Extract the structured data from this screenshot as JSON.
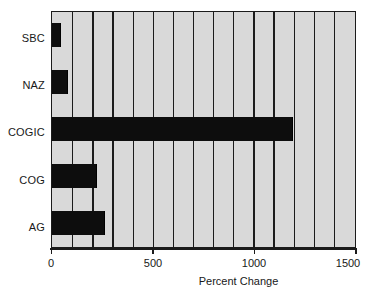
{
  "chart_data": {
    "type": "bar",
    "orientation": "horizontal",
    "title": "",
    "subtitle": "",
    "xlabel": "Percent Change",
    "ylabel": "",
    "xlim": [
      0,
      1500
    ],
    "xticks": [
      0,
      500,
      1000,
      1500
    ],
    "xtick_labels": [
      "0",
      "500",
      "1000",
      "1500"
    ],
    "gridlines": {
      "axis": "x",
      "visible": true,
      "interval": 100,
      "values": [
        100,
        200,
        300,
        400,
        500,
        600,
        700,
        800,
        900,
        1000,
        1100,
        1200,
        1300,
        1400
      ]
    },
    "legend": {
      "visible": false,
      "position": "none"
    },
    "categories": [
      "SBC",
      "NAZ",
      "COGIC",
      "COG",
      "AG"
    ],
    "values": [
      45,
      80,
      1195,
      225,
      265
    ],
    "bars": [
      {
        "label": "SBC",
        "value": 45,
        "color": "#0d0d0d"
      },
      {
        "label": "NAZ",
        "value": 80,
        "color": "#0d0d0d"
      },
      {
        "label": "COGIC",
        "value": 1195,
        "color": "#0d0d0d"
      },
      {
        "label": "COG",
        "value": 225,
        "color": "#0d0d0d"
      },
      {
        "label": "AG",
        "value": 265,
        "color": "#0d0d0d"
      }
    ],
    "colors": {
      "bar": "#0d0d0d",
      "plot_background": "#d9d9d9",
      "axis": "#1b1b1b",
      "text": "#181818",
      "page_background": "#ffffff"
    }
  }
}
